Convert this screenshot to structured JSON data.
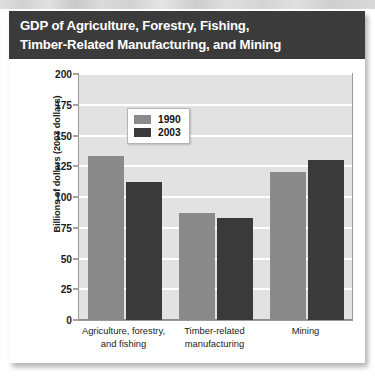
{
  "figure": {
    "title_lines": [
      "GDP of Agriculture, Forestry, Fishing,",
      "Timber-Related Manufacturing, and Mining"
    ]
  },
  "colors": {
    "banner_background": "#3b3b3b",
    "title_text": "#ffffff",
    "plot_background": "#e2e2e2",
    "gridline": "#ffffff",
    "series_1990": "#8a8a8a",
    "series_2003": "#3a3a3a",
    "card_background": "#ffffff"
  },
  "chart_data": {
    "type": "bar",
    "title": "GDP of Agriculture, Forestry, Fishing, Timber-Related Manufacturing, and Mining",
    "xlabel": "",
    "ylabel": "Billions of dollars (2003 dollars)",
    "ylim": [
      0,
      200
    ],
    "yticks": [
      0,
      25,
      50,
      75,
      100,
      125,
      150,
      175,
      200
    ],
    "ytick_labels": [
      "0",
      "25",
      "50",
      "75",
      "100",
      "125",
      "150",
      "175",
      "200"
    ],
    "grid": true,
    "legend_position": "upper center",
    "categories": [
      "Agriculture, forestry, and fishing",
      "Timber-related manufacturing",
      "Mining"
    ],
    "category_label_lines": [
      [
        "Agriculture, forestry,",
        "and fishing"
      ],
      [
        "Timber-related",
        "manufacturing"
      ],
      [
        "Mining"
      ]
    ],
    "series": [
      {
        "name": "1990",
        "color": "#8a8a8a",
        "values": [
          133,
          87,
          120
        ]
      },
      {
        "name": "2003",
        "color": "#3a3a3a",
        "values": [
          112,
          83,
          130
        ]
      }
    ]
  }
}
